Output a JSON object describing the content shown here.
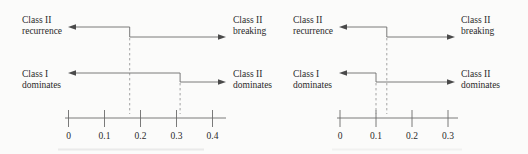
{
  "figure": {
    "background_color": "#fbfbfa",
    "line_color": "#6b6b6b",
    "dash_color": "#999999",
    "arrowhead_color": "#4a4a4a",
    "text_color": "#2a2a2a",
    "panels": [
      {
        "name": "left-panel",
        "labels": {
          "top_left": [
            "Class II",
            "recurrence"
          ],
          "top_right": [
            "Class II",
            "breaking"
          ],
          "mid_left": [
            "Class I",
            "dominates"
          ],
          "mid_right": [
            "Class II",
            "dominates"
          ]
        },
        "axis": {
          "min": 0,
          "max": 0.4,
          "tick_step": 0.1,
          "tick_labels": [
            "0",
            "0.1",
            "0.2",
            "0.3",
            "0.4"
          ]
        },
        "boundaries": {
          "recurrence_breaking": 0.17,
          "dominates": 0.31
        }
      },
      {
        "name": "right-panel",
        "labels": {
          "top_left": [
            "Class II",
            "recurrence"
          ],
          "top_right": [
            "Class II",
            "breaking"
          ],
          "mid_left": [
            "Class I",
            "dominates"
          ],
          "mid_right": [
            "Class II",
            "dominates"
          ]
        },
        "axis": {
          "min": 0,
          "max": 0.3,
          "tick_step": 0.1,
          "tick_labels": [
            "0",
            "0.1",
            "0.2",
            "0.3"
          ]
        },
        "boundaries": {
          "recurrence_breaking": 0.13,
          "dominates": 0.1
        }
      }
    ]
  }
}
